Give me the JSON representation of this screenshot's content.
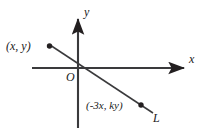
{
  "figure": {
    "type": "coordinate-plane-diagram",
    "background_color": "#ffffff",
    "stroke_color": "#231f20",
    "axes": {
      "x_axis_label": "x",
      "y_axis_label": "y",
      "origin_label": "O"
    },
    "line": {
      "name_label": "L",
      "description": "straight line through the origin with negative slope"
    },
    "points": [
      {
        "label": "(x, y)",
        "position": "upper-left"
      },
      {
        "label": "(-3x, ky)",
        "position": "lower-right"
      }
    ]
  },
  "geometry": {
    "x_axis": {
      "x1": 32,
      "y1": 68,
      "x2": 186,
      "y2": 68
    },
    "y_axis": {
      "x1": 78,
      "y1": 128,
      "x2": 78,
      "y2": 17
    },
    "line_L": {
      "x1": 50,
      "y1": 45,
      "x2": 153,
      "y2": 113
    },
    "dot_1": {
      "cx": 49,
      "cy": 46,
      "r": 2.6
    },
    "dot_2": {
      "cx": 141,
      "cy": 105,
      "r": 2.6
    }
  }
}
